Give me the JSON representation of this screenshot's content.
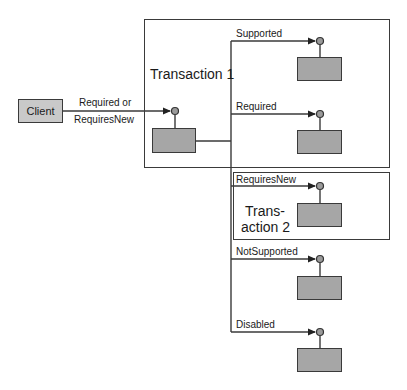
{
  "diagram": {
    "client": {
      "label": "Client"
    },
    "client_call": {
      "line1": "Required or",
      "line2": "RequiresNew"
    },
    "transaction1": {
      "label": "Transaction 1"
    },
    "transaction2": {
      "line1": "Trans-",
      "line2": "action 2"
    },
    "branches": [
      {
        "label": "Supported",
        "in_container": "transaction1"
      },
      {
        "label": "Required",
        "in_container": "transaction1"
      },
      {
        "label": "RequiresNew",
        "in_container": "transaction2"
      },
      {
        "label": "NotSupported",
        "in_container": "none"
      },
      {
        "label": "Disabled",
        "in_container": "none"
      }
    ],
    "colors": {
      "line": "#3a3a3a",
      "component_fill": "#a6a6a6",
      "client_fill": "#c9c9c9",
      "port_fill": "#9a9a9a"
    }
  }
}
